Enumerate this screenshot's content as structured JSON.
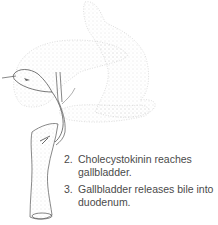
{
  "figure": {
    "colors": {
      "stipple": "#b8b8b8",
      "line": "#555555",
      "text": "#4a4a4a",
      "background": "#ffffff"
    }
  },
  "steps": [
    {
      "number": "2.",
      "text": "Cholecystokinin reaches gallbladder."
    },
    {
      "number": "3.",
      "text": "Gallbladder releases bile into duodenum."
    }
  ]
}
